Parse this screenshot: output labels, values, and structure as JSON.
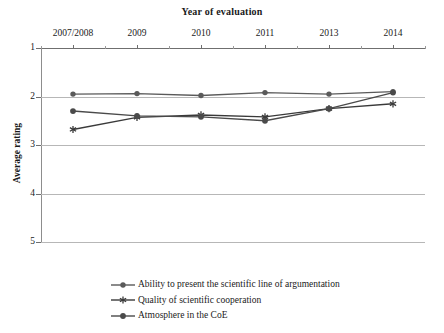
{
  "chart_data": {
    "type": "line",
    "title": "Year of evaluation",
    "xlabel": "Year of evaluation",
    "ylabel": "Average rating",
    "categories": [
      "2007/2008",
      "2009",
      "2010",
      "2011",
      "2013",
      "2014"
    ],
    "ylim": [
      1,
      5
    ],
    "y_inverted": true,
    "yticks": [
      1,
      2,
      3,
      4,
      5
    ],
    "ytick_labels": [
      "1",
      "2",
      "3",
      "4",
      "5"
    ],
    "grid": true,
    "legend_position": "bottom",
    "series": [
      {
        "name": "Ability to present the scientific line of argumentation",
        "marker": "circle",
        "color": "#5a5a5a",
        "values": [
          1.95,
          1.94,
          1.98,
          1.92,
          1.95,
          1.9
        ]
      },
      {
        "name": "Quality of scientific cooperation",
        "marker": "asterisk",
        "color": "#3a3a3a",
        "values": [
          2.68,
          2.43,
          2.38,
          2.42,
          2.25,
          2.15
        ]
      },
      {
        "name": "Atmosphere in the CoE",
        "marker": "circle-filled",
        "color": "#4a4a4a",
        "values": [
          2.3,
          2.4,
          2.42,
          2.5,
          2.25,
          1.92
        ]
      }
    ]
  },
  "axes": {
    "y_title": "Average rating",
    "x_title": "Year of evaluation"
  },
  "colors": {
    "grid": "#b7b7b7",
    "axis": "#6f6f6f",
    "text": "#1a1a1a",
    "background": "#ffffff"
  }
}
